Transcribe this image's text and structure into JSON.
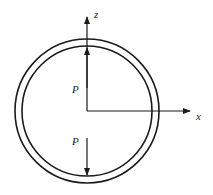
{
  "diagram": {
    "axes": {
      "x_label": "x",
      "z_label": "z"
    },
    "forces": [
      {
        "label": "P",
        "direction": "up"
      },
      {
        "label": "P",
        "direction": "down"
      }
    ],
    "stroke_color": "#1a1a1a"
  }
}
